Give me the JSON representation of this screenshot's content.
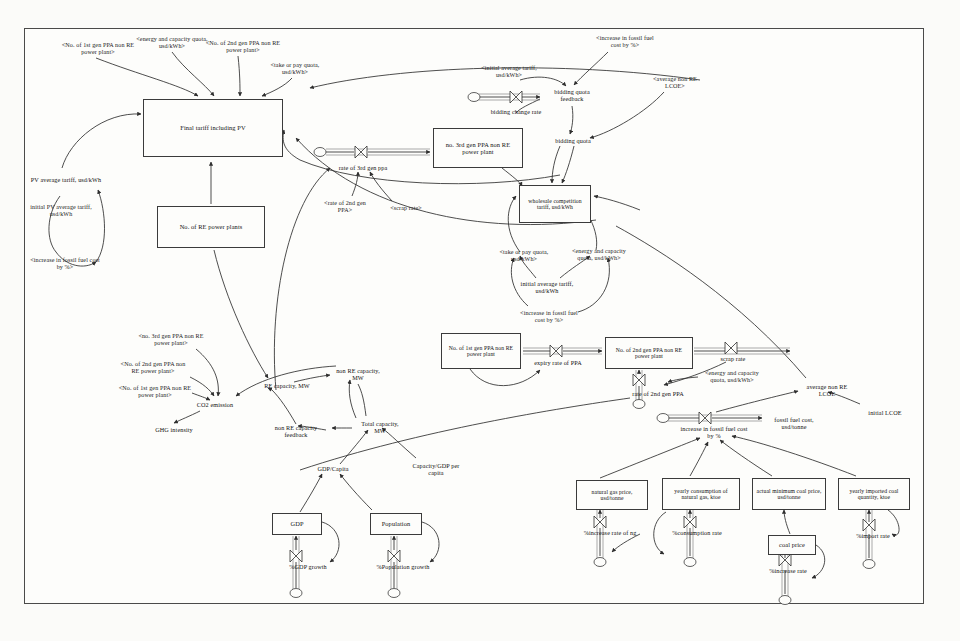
{
  "diagram": {
    "type": "stock-and-flow causal loop diagram",
    "border_color": "#4a4a4a",
    "line_color": "#333333",
    "background": "#fdfdfb"
  },
  "stocks": [
    {
      "id": "final_tariff",
      "label": "Final tariff including PV",
      "x": 143,
      "y": 99,
      "w": 140,
      "h": 58
    },
    {
      "id": "re_plants",
      "label": "No. of RE power plants",
      "x": 157,
      "y": 206,
      "w": 108,
      "h": 42
    },
    {
      "id": "gen3_ppa",
      "label": "no. 3rd gen PPA non RE power plant",
      "x": 433,
      "y": 128,
      "w": 90,
      "h": 40
    },
    {
      "id": "wholesale",
      "label": "wholesale competition tariff, usd/kWh",
      "x": 519,
      "y": 185,
      "w": 72,
      "h": 38
    },
    {
      "id": "gen1_ppa",
      "label": "No. of 1st gen PPA non RE power plant",
      "x": 441,
      "y": 333,
      "w": 80,
      "h": 36
    },
    {
      "id": "gen2_ppa",
      "label": "No. of 2nd gen PPA non RE power plant",
      "x": 605,
      "y": 337,
      "w": 88,
      "h": 32
    },
    {
      "id": "gdp",
      "label": "GDP",
      "x": 272,
      "y": 513,
      "w": 50,
      "h": 22
    },
    {
      "id": "population",
      "label": "Population",
      "x": 370,
      "y": 513,
      "w": 52,
      "h": 22
    },
    {
      "id": "ng_price",
      "label": "natural gas price, usd/tonne",
      "x": 576,
      "y": 480,
      "w": 72,
      "h": 30
    },
    {
      "id": "ng_consumption",
      "label": "yearly consumption of natural gas, ktoe",
      "x": 662,
      "y": 478,
      "w": 78,
      "h": 32
    },
    {
      "id": "min_coal_price",
      "label": "actual minimum coal price, usd/tonne",
      "x": 752,
      "y": 478,
      "w": 74,
      "h": 32
    },
    {
      "id": "coal_import",
      "label": "yearly imported coal quantity, ktoe",
      "x": 838,
      "y": 478,
      "w": 72,
      "h": 32
    },
    {
      "id": "coal_price",
      "label": "coal price",
      "x": 768,
      "y": 535,
      "w": 48,
      "h": 20
    }
  ],
  "auxiliaries": [
    {
      "id": "pv_tariff",
      "label": "PV average tariff, usd/kWh",
      "x": 30,
      "y": 170,
      "w": 72,
      "h": 20
    },
    {
      "id": "bidding_feedback",
      "label": "bidding quota feedback",
      "x": 543,
      "y": 87,
      "w": 58,
      "h": 18
    },
    {
      "id": "bidding_change",
      "label": "bidding change rate",
      "x": 488,
      "y": 103,
      "w": 56,
      "h": 18
    },
    {
      "id": "bidding_quota",
      "label": "bidding quota",
      "x": 547,
      "y": 136,
      "w": 52,
      "h": 10
    },
    {
      "id": "rate_3rd",
      "label": "rate of 3rd gen ppa",
      "x": 338,
      "y": 159,
      "w": 50,
      "h": 18
    },
    {
      "id": "init_avg_tariff",
      "label": "initial average tariff, usd/kWh",
      "x": 516,
      "y": 279,
      "w": 62,
      "h": 18
    },
    {
      "id": "expiry_rate",
      "label": "expiry rate of PPA",
      "x": 530,
      "y": 358,
      "w": 56,
      "h": 10
    },
    {
      "id": "scrap_rate",
      "label": "scrap rate",
      "x": 712,
      "y": 354,
      "w": 42,
      "h": 10
    },
    {
      "id": "rate_2nd",
      "label": "rate of 2nd gen PPA",
      "x": 632,
      "y": 385,
      "w": 52,
      "h": 18
    },
    {
      "id": "co2",
      "label": "CO2 emission",
      "x": 186,
      "y": 400,
      "w": 58,
      "h": 10
    },
    {
      "id": "ghg",
      "label": "GHG intensity",
      "x": 146,
      "y": 425,
      "w": 56,
      "h": 10
    },
    {
      "id": "re_capacity",
      "label": "RE capacity, MW",
      "x": 258,
      "y": 381,
      "w": 58,
      "h": 10
    },
    {
      "id": "nonre_capacity",
      "label": "non RE capacity, MW",
      "x": 333,
      "y": 366,
      "w": 50,
      "h": 18
    },
    {
      "id": "nonre_feedback",
      "label": "non RE capacity feedback",
      "x": 268,
      "y": 423,
      "w": 56,
      "h": 18
    },
    {
      "id": "total_capacity",
      "label": "Total capacity, MW",
      "x": 355,
      "y": 419,
      "w": 50,
      "h": 18
    },
    {
      "id": "gdp_capita",
      "label": "GDP/Capita",
      "x": 307,
      "y": 464,
      "w": 52,
      "h": 10
    },
    {
      "id": "cap_gdp_capita",
      "label": "Capacity/GDP per capita",
      "x": 408,
      "y": 461,
      "w": 56,
      "h": 18
    },
    {
      "id": "gdp_growth",
      "label": "%GDP growth",
      "x": 282,
      "y": 562,
      "w": 52,
      "h": 10
    },
    {
      "id": "pop_growth",
      "label": "%Population growth",
      "x": 372,
      "y": 562,
      "w": 62,
      "h": 10
    },
    {
      "id": "fossil_increase",
      "label": "increase in fossil fuel cost by %",
      "x": 680,
      "y": 424,
      "w": 68,
      "h": 18
    },
    {
      "id": "fossil_cost",
      "label": "fossil fuel cost, usd/tonne",
      "x": 766,
      "y": 415,
      "w": 56,
      "h": 18
    },
    {
      "id": "avg_lcoe",
      "label": "average non RE LCOE",
      "x": 800,
      "y": 382,
      "w": 54,
      "h": 18
    },
    {
      "id": "init_lcoe",
      "label": "initial LCOE",
      "x": 862,
      "y": 408,
      "w": 46,
      "h": 10
    },
    {
      "id": "ng_increase",
      "label": "%increase rate of ng",
      "x": 580,
      "y": 528,
      "w": 60,
      "h": 10
    },
    {
      "id": "ng_cons_rate",
      "label": "%consumption rate",
      "x": 668,
      "y": 528,
      "w": 58,
      "h": 10
    },
    {
      "id": "coal_inc_rate",
      "label": "%increase rate",
      "x": 762,
      "y": 566,
      "w": 52,
      "h": 10
    },
    {
      "id": "coal_import_rate",
      "label": "%import rate",
      "x": 848,
      "y": 531,
      "w": 50,
      "h": 10
    }
  ],
  "shadow_variables": [
    {
      "id": "sh_gen1_top",
      "label": "<No. of 1st gen PPA non RE power plant>",
      "x": 58,
      "y": 40,
      "w": 80,
      "h": 18
    },
    {
      "id": "sh_energy_top",
      "label": "<energy and capacity quota, usd/kWh>",
      "x": 136,
      "y": 34,
      "w": 72,
      "h": 18
    },
    {
      "id": "sh_gen2_top",
      "label": "<No. of 2nd gen PPA non RE power plant>",
      "x": 205,
      "y": 38,
      "w": 76,
      "h": 18
    },
    {
      "id": "sh_takepay_top",
      "label": "<take or pay quota, usd/kWh>",
      "x": 262,
      "y": 60,
      "w": 66,
      "h": 18
    },
    {
      "id": "sh_init_pv",
      "label": "initial PV average tariff, usd/kWh",
      "x": 28,
      "y": 202,
      "w": 66,
      "h": 18
    },
    {
      "id": "sh_fossil_left",
      "label": "<increase in fossil fuel cost by %>",
      "x": 30,
      "y": 255,
      "w": 70,
      "h": 18
    },
    {
      "id": "sh_init_avg_bid",
      "label": "<initial average tariff, usd/kWh>",
      "x": 478,
      "y": 63,
      "w": 62,
      "h": 18
    },
    {
      "id": "sh_fossil_bid",
      "label": "<increase in fossil fuel cost by %>",
      "x": 592,
      "y": 33,
      "w": 66,
      "h": 18
    },
    {
      "id": "sh_lcoe_bid",
      "label": "<average non RE LCOE>",
      "x": 646,
      "y": 74,
      "w": 58,
      "h": 18
    },
    {
      "id": "sh_rate2nd_mid",
      "label": "<rate of 2nd gen PPA>",
      "x": 319,
      "y": 198,
      "w": 52,
      "h": 18
    },
    {
      "id": "sh_scrap_mid",
      "label": "<scrap rate>",
      "x": 384,
      "y": 203,
      "w": 44,
      "h": 10
    },
    {
      "id": "sh_takepay_mid",
      "label": "<take or pay quota, usd/kWh>",
      "x": 497,
      "y": 244,
      "w": 54,
      "h": 24
    },
    {
      "id": "sh_energy_mid",
      "label": "<energy and capacity quota, usd/kWh>",
      "x": 568,
      "y": 243,
      "w": 62,
      "h": 24
    },
    {
      "id": "sh_fossil_mid",
      "label": "<increase in fossil fuel cost by %>",
      "x": 518,
      "y": 308,
      "w": 62,
      "h": 18
    },
    {
      "id": "sh_gen3_co2",
      "label": "<no. 3rd gen PPA non RE power plant>",
      "x": 134,
      "y": 331,
      "w": 74,
      "h": 18
    },
    {
      "id": "sh_gen2_co2",
      "label": "<No. of 2nd gen PPA non RE power plant>",
      "x": 116,
      "y": 359,
      "w": 74,
      "h": 18
    },
    {
      "id": "sh_gen1_co2",
      "label": "<No. of 1st gen PPA non RE power plant>",
      "x": 118,
      "y": 383,
      "w": 74,
      "h": 18
    },
    {
      "id": "sh_energy_right",
      "label": "<energy and capacity quota, usd/kWh>",
      "x": 700,
      "y": 368,
      "w": 64,
      "h": 18
    }
  ],
  "flow_valves": [
    {
      "id": "valve_bidding",
      "x": 516,
      "y": 97,
      "label": ""
    },
    {
      "id": "valve_rate3",
      "x": 361,
      "y": 152,
      "label": ""
    },
    {
      "id": "valve_expiry",
      "x": 556,
      "y": 351,
      "label": ""
    },
    {
      "id": "valve_scrap",
      "x": 731,
      "y": 348,
      "label": ""
    },
    {
      "id": "valve_rate2",
      "x": 634,
      "y": 380,
      "label": ""
    },
    {
      "id": "valve_gdp",
      "x": 296,
      "y": 556,
      "label": ""
    },
    {
      "id": "valve_pop",
      "x": 394,
      "y": 556,
      "label": ""
    },
    {
      "id": "valve_fossil",
      "x": 705,
      "y": 418,
      "label": ""
    },
    {
      "id": "valve_ng",
      "x": 600,
      "y": 522,
      "label": ""
    },
    {
      "id": "valve_ngcons",
      "x": 690,
      "y": 522,
      "label": ""
    },
    {
      "id": "valve_coal",
      "x": 785,
      "y": 560,
      "label": ""
    },
    {
      "id": "valve_import",
      "x": 869,
      "y": 525,
      "label": ""
    }
  ],
  "sources": [
    {
      "id": "src_bidding",
      "x": 474,
      "y": 97
    },
    {
      "id": "src_rate3",
      "x": 320,
      "y": 152
    },
    {
      "id": "src_rate2",
      "x": 639,
      "y": 404
    },
    {
      "id": "src_gdp",
      "x": 296,
      "y": 593
    },
    {
      "id": "src_pop",
      "x": 394,
      "y": 593
    },
    {
      "id": "src_fossil",
      "x": 663,
      "y": 418
    },
    {
      "id": "src_ng",
      "x": 600,
      "y": 560
    },
    {
      "id": "src_ngcons",
      "x": 690,
      "y": 560
    },
    {
      "id": "src_coal",
      "x": 785,
      "y": 598
    },
    {
      "id": "src_import",
      "x": 869,
      "y": 562
    }
  ]
}
